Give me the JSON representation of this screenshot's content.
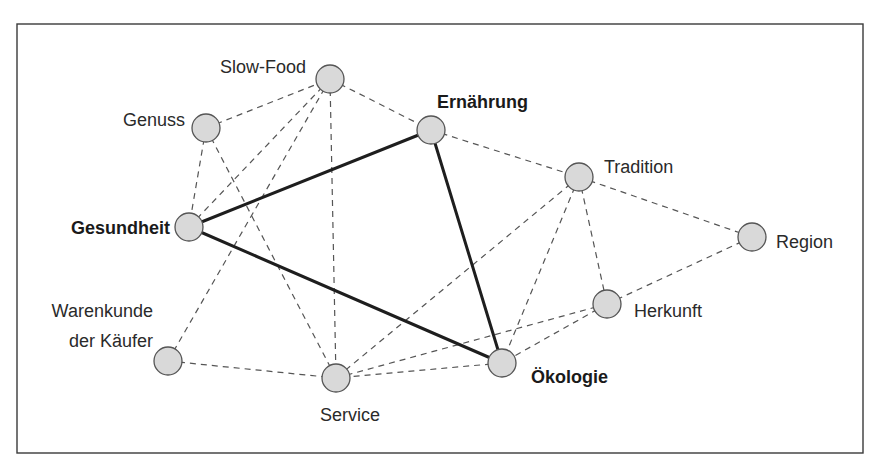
{
  "diagram": {
    "type": "network",
    "frame": {
      "x": 17,
      "y": 24,
      "width": 846,
      "height": 429
    },
    "node_radius": 14,
    "colors": {
      "node_fill": "#d9d9d9",
      "node_stroke": "#555555",
      "dashed_edge": "#555555",
      "solid_edge": "#1e1e1e",
      "frame": "#3a3a3a"
    },
    "nodes": [
      {
        "id": "slowfood",
        "label": "Slow-Food",
        "x": 330,
        "y": 79,
        "bold": false,
        "label_lines": [
          "Slow-Food"
        ],
        "label_x": 306,
        "label_y": 73,
        "anchor": "end"
      },
      {
        "id": "genuss",
        "label": "Genuss",
        "x": 206,
        "y": 128,
        "bold": false,
        "label_lines": [
          "Genuss"
        ],
        "label_x": 185,
        "label_y": 126,
        "anchor": "end"
      },
      {
        "id": "ernaehrung",
        "label": "Ernährung",
        "x": 431,
        "y": 130,
        "bold": true,
        "label_lines": [
          "Ernährung"
        ],
        "label_x": 437,
        "label_y": 108,
        "anchor": "start"
      },
      {
        "id": "tradition",
        "label": "Tradition",
        "x": 579,
        "y": 177,
        "bold": false,
        "label_lines": [
          "Tradition"
        ],
        "label_x": 604,
        "label_y": 173,
        "anchor": "start"
      },
      {
        "id": "gesundheit",
        "label": "Gesundheit",
        "x": 189,
        "y": 227,
        "bold": true,
        "label_lines": [
          "Gesundheit"
        ],
        "label_x": 170,
        "label_y": 234,
        "anchor": "end"
      },
      {
        "id": "region",
        "label": "Region",
        "x": 752,
        "y": 237,
        "bold": false,
        "label_lines": [
          "Region"
        ],
        "label_x": 776,
        "label_y": 248,
        "anchor": "start"
      },
      {
        "id": "herkunft",
        "label": "Herkunft",
        "x": 607,
        "y": 304,
        "bold": false,
        "label_lines": [
          "Herkunft"
        ],
        "label_x": 634,
        "label_y": 317,
        "anchor": "start"
      },
      {
        "id": "warenkunde",
        "label": "Warenkunde der Käufer",
        "x": 168,
        "y": 361,
        "bold": false,
        "label_lines": [
          "Warenkunde",
          "der Käufer"
        ],
        "label_x": 153,
        "label_y": 317,
        "anchor": "end"
      },
      {
        "id": "oekologie",
        "label": "Ökologie",
        "x": 502,
        "y": 363,
        "bold": true,
        "label_lines": [
          "Ökologie"
        ],
        "label_x": 531,
        "label_y": 383,
        "anchor": "start"
      },
      {
        "id": "service",
        "label": "Service",
        "x": 336,
        "y": 378,
        "bold": false,
        "label_lines": [
          "Service"
        ],
        "label_x": 350,
        "label_y": 421,
        "anchor": "middle"
      }
    ],
    "edges": [
      {
        "from": "gesundheit",
        "to": "ernaehrung",
        "style": "solid"
      },
      {
        "from": "ernaehrung",
        "to": "oekologie",
        "style": "solid"
      },
      {
        "from": "gesundheit",
        "to": "oekologie",
        "style": "solid"
      },
      {
        "from": "genuss",
        "to": "slowfood",
        "style": "dashed"
      },
      {
        "from": "genuss",
        "to": "gesundheit",
        "style": "dashed"
      },
      {
        "from": "genuss",
        "to": "service",
        "style": "dashed"
      },
      {
        "from": "slowfood",
        "to": "gesundheit",
        "style": "dashed"
      },
      {
        "from": "slowfood",
        "to": "warenkunde",
        "style": "dashed"
      },
      {
        "from": "slowfood",
        "to": "service",
        "style": "dashed"
      },
      {
        "from": "slowfood",
        "to": "ernaehrung",
        "style": "dashed"
      },
      {
        "from": "ernaehrung",
        "to": "tradition",
        "style": "dashed"
      },
      {
        "from": "tradition",
        "to": "region",
        "style": "dashed"
      },
      {
        "from": "tradition",
        "to": "herkunft",
        "style": "dashed"
      },
      {
        "from": "tradition",
        "to": "oekologie",
        "style": "dashed"
      },
      {
        "from": "tradition",
        "to": "service",
        "style": "dashed"
      },
      {
        "from": "region",
        "to": "herkunft",
        "style": "dashed"
      },
      {
        "from": "herkunft",
        "to": "oekologie",
        "style": "dashed"
      },
      {
        "from": "herkunft",
        "to": "service",
        "style": "dashed"
      },
      {
        "from": "oekologie",
        "to": "service",
        "style": "dashed"
      },
      {
        "from": "warenkunde",
        "to": "service",
        "style": "dashed"
      }
    ],
    "highlighted_triangle": [
      "Gesundheit",
      "Ernährung",
      "Ökologie"
    ]
  }
}
